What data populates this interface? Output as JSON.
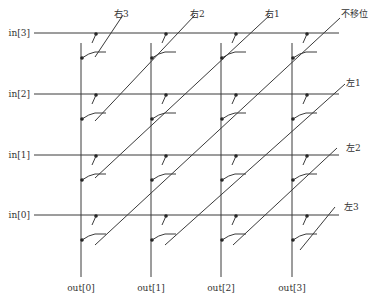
{
  "diagram": {
    "type": "barrel-shifter crossbar",
    "line_color": "#3a3a3a",
    "dot_color": "#222222",
    "inputs": [
      {
        "label": "in[3]",
        "y": 33
      },
      {
        "label": "in[2]",
        "y": 94
      },
      {
        "label": "in[1]",
        "y": 155
      },
      {
        "label": "in[0]",
        "y": 215
      }
    ],
    "outputs": [
      {
        "label": "out[0]",
        "x": 81
      },
      {
        "label": "out[1]",
        "x": 151
      },
      {
        "label": "out[2]",
        "x": 221
      },
      {
        "label": "out[3]",
        "x": 292
      }
    ],
    "shift_lines": [
      {
        "label": "右3",
        "x1": 95,
        "y1": 57,
        "x2": 123,
        "y2": 15,
        "lx": 114,
        "ly": 17
      },
      {
        "label": "右2",
        "x1": 95,
        "y1": 121,
        "x2": 195,
        "y2": 15,
        "lx": 190,
        "ly": 17
      },
      {
        "label": "右1",
        "x1": 95,
        "y1": 178,
        "x2": 270,
        "y2": 15,
        "lx": 265,
        "ly": 17
      },
      {
        "label": "不移位",
        "x1": 95,
        "y1": 245,
        "x2": 340,
        "y2": 18,
        "lx": 341,
        "ly": 17
      },
      {
        "label": "左1",
        "x1": 165,
        "y1": 245,
        "x2": 345,
        "y2": 84,
        "lx": 346,
        "ly": 86
      },
      {
        "label": "左2",
        "x1": 233,
        "y1": 245,
        "x2": 337,
        "y2": 148,
        "lx": 346,
        "ly": 151
      },
      {
        "label": "左3",
        "x1": 300,
        "y1": 250,
        "x2": 335,
        "y2": 207,
        "lx": 344,
        "ly": 210
      }
    ]
  }
}
